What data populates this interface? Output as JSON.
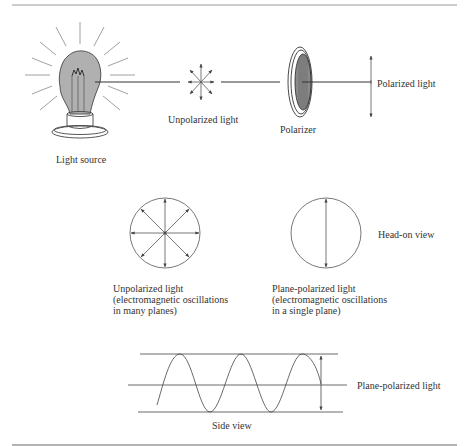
{
  "figure": {
    "top_row": {
      "light_source_label": "Light source",
      "unpolarized_label": "Unpolarized light",
      "polarizer_label": "Polarizer",
      "polarized_label": "Polarized light"
    },
    "head_on": {
      "unpolarized_caption_line1": "Unpolarized light",
      "unpolarized_caption_line2": "(electromagnetic oscillations",
      "unpolarized_caption_line3": "in many planes)",
      "plane_caption_line1": "Plane-polarized light",
      "plane_caption_line2": "(electromagnetic oscillations",
      "plane_caption_line3": "in a single plane)",
      "view_label": "Head-on view"
    },
    "side_view": {
      "wave_label": "Plane-polarized light",
      "view_label": "Side view"
    },
    "colors": {
      "ink": "#333333",
      "bulb_fill": "#b0b0b0",
      "polarizer_fill": "#8a8a8a",
      "rule": "#9a9a9a"
    }
  }
}
